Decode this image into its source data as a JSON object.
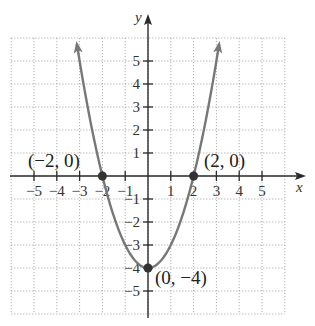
{
  "chart_data": {
    "type": "line",
    "title": "",
    "function": "y = x^2 - 4",
    "xlabel": "x",
    "ylabel": "y",
    "xlim": [
      -6,
      6
    ],
    "ylim": [
      -6,
      6
    ],
    "grid": true,
    "x_ticks": [
      -5,
      -4,
      -3,
      -2,
      -1,
      1,
      2,
      3,
      4,
      5
    ],
    "x_tick_labels": [
      "−5",
      "−4",
      "−3",
      "−2",
      "−1",
      "1",
      "2",
      "3",
      "4",
      "5"
    ],
    "y_ticks": [
      5,
      4,
      3,
      2,
      1,
      -1,
      -2,
      -3,
      -4,
      -5
    ],
    "y_tick_labels": [
      "5",
      "4",
      "3",
      "2",
      "1",
      "−1",
      "−2",
      "−3",
      "−4",
      "−5"
    ],
    "series": [
      {
        "name": "parabola",
        "x": [
          -3.2,
          -3,
          -2.5,
          -2,
          -1.5,
          -1,
          -0.5,
          0,
          0.5,
          1,
          1.5,
          2,
          2.5,
          3,
          3.2
        ],
        "y": [
          6.24,
          5,
          2.25,
          0,
          -1.75,
          -3,
          -3.75,
          -4,
          -3.75,
          -3,
          -1.75,
          0,
          2.25,
          5,
          6.24
        ],
        "color": "#777777",
        "arrows_at_ends": true
      }
    ],
    "annotations": [
      {
        "label": "(−2, 0)",
        "x": -2,
        "y": 0
      },
      {
        "label": "(2, 0)",
        "x": 2,
        "y": 0
      },
      {
        "label": "(0, −4)",
        "x": 0,
        "y": -4
      }
    ]
  },
  "labels": {
    "x_axis": "x",
    "y_axis": "y",
    "point_left": "(−2, 0)",
    "point_right": "(2, 0)",
    "point_vertex": "(0, −4)"
  }
}
